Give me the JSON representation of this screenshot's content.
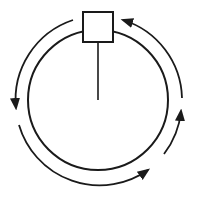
{
  "diagram": {
    "colors": {
      "stroke": "#1a1a1a",
      "background": "#ffffff",
      "box_fill": "#ffffff"
    },
    "circle": {
      "cx": 98,
      "cy": 100,
      "r": 70
    },
    "box": {
      "x": 83,
      "y": 12,
      "w": 30,
      "h": 30
    },
    "stem": {
      "x": 98,
      "y1": 42,
      "y2": 100
    },
    "arrows": [
      {
        "name": "top-left-arrow",
        "direction": "counterclockwise"
      },
      {
        "name": "bottom-left-arrow",
        "direction": "counterclockwise"
      },
      {
        "name": "right-lower-arrow",
        "direction": "counterclockwise"
      },
      {
        "name": "top-right-arrow",
        "direction": "counterclockwise"
      }
    ]
  }
}
